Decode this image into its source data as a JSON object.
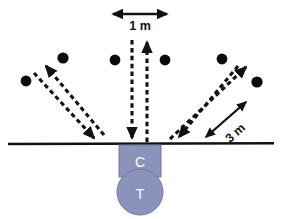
{
  "figure": {
    "background_color": "#ffffff"
  },
  "labels": {
    "spacing_label": "1 m",
    "offset_label": "3 m",
    "cable_label": "C",
    "tool_label": "T"
  },
  "colors": {
    "ground_line": "#111111",
    "ray_stroke": "#111111",
    "dot_fill": "#0a0a0a",
    "equipment_fill": "#8b93bd",
    "equipment_stroke": "#6f77a3",
    "equipment_text": "#ffffff"
  },
  "geometry": {
    "width": 283,
    "height": 219,
    "ground_line_y": 144,
    "ground_line_x1": 8,
    "ground_line_x2": 274,
    "source_x": 140,
    "dot_radius": 5.4
  },
  "geophones": [
    {
      "name": "geophone-1",
      "cx": 26,
      "cy": 81
    },
    {
      "name": "geophone-2",
      "cx": 63,
      "cy": 58
    },
    {
      "name": "geophone-3",
      "cx": 115,
      "cy": 60
    },
    {
      "name": "geophone-4",
      "cx": 165,
      "cy": 60
    },
    {
      "name": "geophone-5",
      "cx": 222,
      "cy": 59
    },
    {
      "name": "geophone-6",
      "cx": 257,
      "cy": 82
    }
  ],
  "rays": [
    {
      "name": "ray-up-left",
      "x1": 104,
      "y1": 135,
      "x2": 44,
      "y2": 64,
      "arrow": "end"
    },
    {
      "name": "ray-down-right",
      "x1": 34,
      "y1": 73,
      "x2": 96,
      "y2": 140,
      "arrow": "end"
    },
    {
      "name": "ray-down-center",
      "x1": 132,
      "y1": 38,
      "x2": 132,
      "y2": 140,
      "arrow": "end"
    },
    {
      "name": "ray-up-center",
      "x1": 147,
      "y1": 142,
      "x2": 147,
      "y2": 40,
      "arrow": "end"
    },
    {
      "name": "ray-down-left-right",
      "x1": 238,
      "y1": 65,
      "x2": 177,
      "y2": 139,
      "arrow": "end"
    },
    {
      "name": "ray-up-right",
      "x1": 170,
      "y1": 140,
      "x2": 248,
      "y2": 65,
      "arrow": "end"
    }
  ],
  "dimensions": {
    "spacing_arrow": {
      "name": "spacing-arrow-1m",
      "x1": 113,
      "y1": 14,
      "x2": 167,
      "y2": 14
    },
    "spacing_text": {
      "x": 140,
      "y": 29
    },
    "offset_arrow": {
      "name": "offset-arrow-3m",
      "x1": 206,
      "y1": 137,
      "x2": 246,
      "y2": 102
    },
    "offset_text": {
      "x": 238,
      "y": 134,
      "rotate": -42
    }
  },
  "equipment": {
    "cable": {
      "x": 119,
      "y": 145,
      "width": 42,
      "height": 32,
      "label_x": 140,
      "label_y": 166
    },
    "tool": {
      "cx": 140,
      "cy": 192,
      "r": 23,
      "label_x": 140,
      "label_y": 199
    }
  }
}
